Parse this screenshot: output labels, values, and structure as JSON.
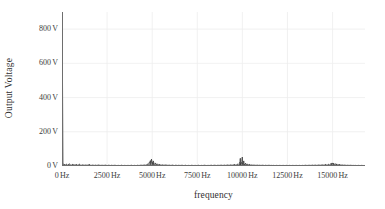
{
  "chart_data": {
    "type": "line",
    "title": "",
    "xlabel": "frequency",
    "ylabel": "Output Voltage",
    "xlim": [
      0,
      16800
    ],
    "ylim": [
      0,
      900
    ],
    "grid": true,
    "legend": null,
    "x_tick_labels": [
      "0 Hz",
      "2500 Hz",
      "5000 Hz",
      "7500 Hz",
      "10000 Hz",
      "12500 Hz",
      "15000 Hz"
    ],
    "x_tick_values": [
      0,
      2500,
      5000,
      7500,
      10000,
      12500,
      15000
    ],
    "y_tick_labels": [
      "0 V",
      "200 V",
      "400 V",
      "600 V",
      "800 V"
    ],
    "y_tick_values": [
      0,
      200,
      400,
      600,
      800
    ],
    "series": [
      {
        "name": "Output Voltage Spectrum",
        "color": "#303030",
        "points": [
          [
            0,
            900
          ],
          [
            60,
            14
          ],
          [
            120,
            9
          ],
          [
            180,
            7
          ],
          [
            240,
            11
          ],
          [
            300,
            6
          ],
          [
            360,
            9
          ],
          [
            420,
            13
          ],
          [
            480,
            7
          ],
          [
            540,
            6
          ],
          [
            600,
            10
          ],
          [
            660,
            8
          ],
          [
            720,
            6
          ],
          [
            780,
            9
          ],
          [
            840,
            5
          ],
          [
            900,
            7
          ],
          [
            960,
            11
          ],
          [
            1020,
            6
          ],
          [
            1080,
            5
          ],
          [
            1140,
            8
          ],
          [
            1200,
            6
          ],
          [
            1260,
            5
          ],
          [
            1320,
            7
          ],
          [
            1380,
            5
          ],
          [
            1440,
            6
          ],
          [
            1500,
            9
          ],
          [
            1560,
            5
          ],
          [
            1620,
            4
          ],
          [
            1680,
            6
          ],
          [
            1740,
            5
          ],
          [
            1800,
            4
          ],
          [
            1860,
            6
          ],
          [
            1920,
            4
          ],
          [
            1980,
            5
          ],
          [
            2040,
            7
          ],
          [
            2100,
            4
          ],
          [
            2160,
            4
          ],
          [
            2220,
            5
          ],
          [
            2280,
            4
          ],
          [
            2340,
            4
          ],
          [
            2400,
            6
          ],
          [
            2460,
            4
          ],
          [
            2520,
            3
          ],
          [
            2580,
            5
          ],
          [
            2640,
            4
          ],
          [
            2700,
            3
          ],
          [
            2760,
            5
          ],
          [
            2820,
            3
          ],
          [
            2880,
            4
          ],
          [
            2940,
            5
          ],
          [
            3000,
            3
          ],
          [
            3060,
            3
          ],
          [
            3120,
            4
          ],
          [
            3180,
            3
          ],
          [
            3240,
            3
          ],
          [
            3300,
            5
          ],
          [
            3360,
            3
          ],
          [
            3420,
            3
          ],
          [
            3480,
            4
          ],
          [
            3540,
            3
          ],
          [
            3600,
            3
          ],
          [
            3660,
            4
          ],
          [
            3720,
            3
          ],
          [
            3780,
            3
          ],
          [
            3840,
            5
          ],
          [
            3900,
            3
          ],
          [
            3960,
            3
          ],
          [
            4020,
            4
          ],
          [
            4080,
            3
          ],
          [
            4140,
            3
          ],
          [
            4200,
            5
          ],
          [
            4260,
            3
          ],
          [
            4320,
            4
          ],
          [
            4380,
            6
          ],
          [
            4440,
            4
          ],
          [
            4500,
            5
          ],
          [
            4560,
            7
          ],
          [
            4620,
            5
          ],
          [
            4680,
            8
          ],
          [
            4740,
            11
          ],
          [
            4800,
            14
          ],
          [
            4860,
            24
          ],
          [
            4900,
            32
          ],
          [
            4920,
            16
          ],
          [
            4960,
            40
          ],
          [
            5000,
            22
          ],
          [
            5020,
            12
          ],
          [
            5060,
            30
          ],
          [
            5100,
            16
          ],
          [
            5140,
            10
          ],
          [
            5180,
            18
          ],
          [
            5220,
            11
          ],
          [
            5260,
            8
          ],
          [
            5300,
            13
          ],
          [
            5340,
            8
          ],
          [
            5400,
            9
          ],
          [
            5460,
            7
          ],
          [
            5520,
            6
          ],
          [
            5580,
            8
          ],
          [
            5640,
            5
          ],
          [
            5700,
            6
          ],
          [
            5760,
            7
          ],
          [
            5820,
            5
          ],
          [
            5880,
            4
          ],
          [
            5940,
            6
          ],
          [
            6000,
            4
          ],
          [
            6060,
            4
          ],
          [
            6120,
            6
          ],
          [
            6180,
            4
          ],
          [
            6240,
            3
          ],
          [
            6300,
            5
          ],
          [
            6360,
            4
          ],
          [
            6420,
            3
          ],
          [
            6480,
            5
          ],
          [
            6540,
            3
          ],
          [
            6600,
            4
          ],
          [
            6660,
            5
          ],
          [
            6720,
            3
          ],
          [
            6780,
            3
          ],
          [
            6840,
            5
          ],
          [
            6900,
            3
          ],
          [
            6960,
            3
          ],
          [
            7020,
            4
          ],
          [
            7080,
            3
          ],
          [
            7140,
            3
          ],
          [
            7200,
            5
          ],
          [
            7260,
            3
          ],
          [
            7320,
            3
          ],
          [
            7380,
            4
          ],
          [
            7440,
            3
          ],
          [
            7500,
            3
          ],
          [
            7560,
            5
          ],
          [
            7620,
            3
          ],
          [
            7680,
            3
          ],
          [
            7740,
            4
          ],
          [
            7800,
            3
          ],
          [
            7860,
            4
          ],
          [
            7920,
            5
          ],
          [
            7980,
            3
          ],
          [
            8040,
            3
          ],
          [
            8100,
            4
          ],
          [
            8160,
            3
          ],
          [
            8220,
            4
          ],
          [
            8280,
            5
          ],
          [
            8340,
            3
          ],
          [
            8400,
            4
          ],
          [
            8460,
            5
          ],
          [
            8520,
            4
          ],
          [
            8580,
            3
          ],
          [
            8640,
            5
          ],
          [
            8700,
            4
          ],
          [
            8760,
            4
          ],
          [
            8820,
            6
          ],
          [
            8880,
            4
          ],
          [
            8940,
            4
          ],
          [
            9000,
            6
          ],
          [
            9060,
            4
          ],
          [
            9120,
            5
          ],
          [
            9180,
            7
          ],
          [
            9240,
            5
          ],
          [
            9300,
            5
          ],
          [
            9360,
            8
          ],
          [
            9420,
            5
          ],
          [
            9480,
            6
          ],
          [
            9540,
            9
          ],
          [
            9600,
            6
          ],
          [
            9660,
            7
          ],
          [
            9720,
            11
          ],
          [
            9780,
            8
          ],
          [
            9820,
            14
          ],
          [
            9860,
            22
          ],
          [
            9880,
            44
          ],
          [
            9900,
            18
          ],
          [
            9920,
            10
          ],
          [
            9960,
            26
          ],
          [
            9990,
            52
          ],
          [
            10010,
            20
          ],
          [
            10040,
            12
          ],
          [
            10080,
            30
          ],
          [
            10110,
            14
          ],
          [
            10140,
            9
          ],
          [
            10180,
            16
          ],
          [
            10220,
            10
          ],
          [
            10260,
            8
          ],
          [
            10300,
            12
          ],
          [
            10340,
            7
          ],
          [
            10400,
            9
          ],
          [
            10460,
            6
          ],
          [
            10520,
            7
          ],
          [
            10580,
            5
          ],
          [
            10640,
            6
          ],
          [
            10700,
            5
          ],
          [
            10760,
            4
          ],
          [
            10820,
            6
          ],
          [
            10880,
            4
          ],
          [
            10940,
            5
          ],
          [
            11000,
            4
          ],
          [
            11060,
            4
          ],
          [
            11120,
            5
          ],
          [
            11180,
            4
          ],
          [
            11240,
            3
          ],
          [
            11300,
            5
          ],
          [
            11360,
            3
          ],
          [
            11420,
            4
          ],
          [
            11480,
            5
          ],
          [
            11540,
            3
          ],
          [
            11600,
            4
          ],
          [
            11660,
            3
          ],
          [
            11720,
            4
          ],
          [
            11780,
            3
          ],
          [
            11840,
            3
          ],
          [
            11900,
            4
          ],
          [
            11960,
            3
          ],
          [
            12020,
            3
          ],
          [
            12080,
            4
          ],
          [
            12140,
            3
          ],
          [
            12200,
            3
          ],
          [
            12260,
            4
          ],
          [
            12320,
            3
          ],
          [
            12380,
            3
          ],
          [
            12440,
            4
          ],
          [
            12500,
            3
          ],
          [
            12560,
            3
          ],
          [
            12620,
            4
          ],
          [
            12680,
            3
          ],
          [
            12740,
            3
          ],
          [
            12800,
            4
          ],
          [
            12860,
            3
          ],
          [
            12920,
            3
          ],
          [
            12980,
            4
          ],
          [
            13040,
            3
          ],
          [
            13100,
            3
          ],
          [
            13160,
            4
          ],
          [
            13220,
            3
          ],
          [
            13280,
            3
          ],
          [
            13340,
            4
          ],
          [
            13400,
            3
          ],
          [
            13460,
            4
          ],
          [
            13520,
            5
          ],
          [
            13580,
            3
          ],
          [
            13640,
            4
          ],
          [
            13700,
            5
          ],
          [
            13760,
            4
          ],
          [
            13820,
            4
          ],
          [
            13880,
            6
          ],
          [
            13940,
            4
          ],
          [
            14000,
            5
          ],
          [
            14060,
            6
          ],
          [
            14120,
            4
          ],
          [
            14180,
            5
          ],
          [
            14240,
            7
          ],
          [
            14300,
            5
          ],
          [
            14360,
            5
          ],
          [
            14420,
            8
          ],
          [
            14480,
            6
          ],
          [
            14540,
            6
          ],
          [
            14600,
            9
          ],
          [
            14660,
            7
          ],
          [
            14720,
            7
          ],
          [
            14780,
            10
          ],
          [
            14840,
            8
          ],
          [
            14880,
            12
          ],
          [
            14920,
            16
          ],
          [
            14960,
            11
          ],
          [
            15000,
            18
          ],
          [
            15040,
            13
          ],
          [
            15080,
            15
          ],
          [
            15120,
            10
          ],
          [
            15160,
            14
          ],
          [
            15200,
            9
          ],
          [
            15240,
            11
          ],
          [
            15300,
            8
          ],
          [
            15360,
            9
          ],
          [
            15420,
            7
          ],
          [
            15480,
            6
          ],
          [
            15540,
            7
          ],
          [
            15600,
            5
          ],
          [
            15660,
            6
          ],
          [
            15720,
            5
          ],
          [
            15780,
            4
          ],
          [
            15840,
            5
          ],
          [
            15900,
            4
          ],
          [
            15960,
            4
          ],
          [
            16020,
            5
          ],
          [
            16080,
            3
          ],
          [
            16140,
            4
          ],
          [
            16200,
            3
          ],
          [
            16260,
            4
          ],
          [
            16320,
            3
          ],
          [
            16380,
            3
          ],
          [
            16440,
            4
          ],
          [
            16500,
            3
          ],
          [
            16560,
            3
          ],
          [
            16620,
            4
          ],
          [
            16680,
            3
          ],
          [
            16740,
            3
          ],
          [
            16800,
            3
          ]
        ]
      }
    ]
  },
  "axes": {
    "y_title": "Output Voltage",
    "x_title": "frequency",
    "y_ticks": [
      {
        "label_value": "0",
        "label_unit": "V",
        "value": 0
      },
      {
        "label_value": "200",
        "label_unit": "V",
        "value": 200
      },
      {
        "label_value": "400",
        "label_unit": "V",
        "value": 400
      },
      {
        "label_value": "600",
        "label_unit": "V",
        "value": 600
      },
      {
        "label_value": "800",
        "label_unit": "V",
        "value": 800
      }
    ],
    "x_ticks": [
      {
        "label_value": "0",
        "label_unit": "Hz",
        "value": 0
      },
      {
        "label_value": "2500",
        "label_unit": "Hz",
        "value": 2500
      },
      {
        "label_value": "5000",
        "label_unit": "Hz",
        "value": 5000
      },
      {
        "label_value": "7500",
        "label_unit": "Hz",
        "value": 7500
      },
      {
        "label_value": "10000",
        "label_unit": "Hz",
        "value": 10000
      },
      {
        "label_value": "12500",
        "label_unit": "Hz",
        "value": 12500
      },
      {
        "label_value": "15000",
        "label_unit": "Hz",
        "value": 15000
      }
    ]
  },
  "style": {
    "grid_color": "#ededed",
    "axis_color": "#6e6e6e",
    "data_color": "#303030",
    "background": "#ffffff"
  }
}
